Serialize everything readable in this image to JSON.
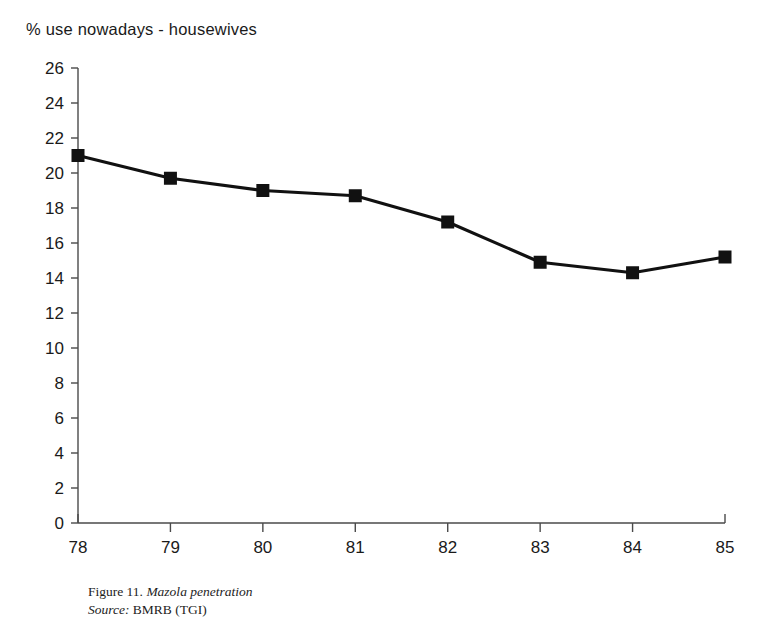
{
  "title": "% use nowadays - housewives",
  "caption": {
    "figure_label": "Figure 11.",
    "figure_title": "Mazola penetration",
    "source_label": "Source:",
    "source_value": "BMRB (TGI)"
  },
  "colors": {
    "line": "#111111",
    "marker": "#111111",
    "axis": "#4a4a4a",
    "text": "#1a1a1a"
  },
  "chart_data": {
    "type": "line",
    "title": "% use nowadays - housewives",
    "xlabel": "",
    "ylabel": "",
    "x": [
      "78",
      "79",
      "80",
      "81",
      "82",
      "83",
      "84",
      "85"
    ],
    "categories": [
      "78",
      "79",
      "80",
      "81",
      "82",
      "83",
      "84",
      "85"
    ],
    "values": [
      21.0,
      19.7,
      19.0,
      18.7,
      17.2,
      14.9,
      14.3,
      15.2
    ],
    "series": [
      {
        "name": "Mazola penetration",
        "values": [
          21.0,
          19.7,
          19.0,
          18.7,
          17.2,
          14.9,
          14.3,
          15.2
        ]
      }
    ],
    "ylim": [
      0,
      26
    ],
    "ytick_step": 2,
    "yticks": [
      0,
      2,
      4,
      6,
      8,
      10,
      12,
      14,
      16,
      18,
      20,
      22,
      24,
      26
    ],
    "ytick_labels": [
      "0",
      "2",
      "4",
      "6",
      "8",
      "10",
      "12",
      "14",
      "16",
      "18",
      "20",
      "22",
      "24",
      "26"
    ],
    "xtick_labels": [
      "78",
      "79",
      "80",
      "81",
      "82",
      "83",
      "84",
      "85"
    ],
    "grid": false,
    "legend": false,
    "marker": "square"
  }
}
